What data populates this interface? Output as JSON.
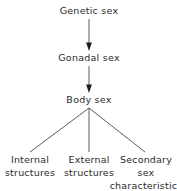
{
  "diagram": {
    "type": "flowchart",
    "background_color": "#ffffff",
    "text_color": "#2b2b2b",
    "line_color": "#4a4a4a",
    "nodes": [
      {
        "id": "genetic",
        "label": "Genetic sex",
        "x": 89,
        "y": 11
      },
      {
        "id": "gonadal",
        "label": "Gonadal sex",
        "x": 89,
        "y": 58
      },
      {
        "id": "body",
        "label": "Body sex",
        "x": 89,
        "y": 100
      }
    ],
    "leaves": [
      {
        "id": "internal",
        "lines": [
          "Internal",
          "structures"
        ],
        "x": 30
      },
      {
        "id": "external",
        "lines": [
          "External",
          "structures"
        ],
        "x": 89
      },
      {
        "id": "secondary",
        "lines": [
          "Secondary",
          "sex",
          "characteristics"
        ],
        "x": 146
      }
    ],
    "edges": [
      {
        "from": "genetic",
        "to": "gonadal",
        "style": "arrow"
      },
      {
        "from": "gonadal",
        "to": "body",
        "style": "arrow"
      },
      {
        "from": "body",
        "to": "internal",
        "style": "line"
      },
      {
        "from": "body",
        "to": "external",
        "style": "line"
      },
      {
        "from": "body",
        "to": "secondary",
        "style": "line"
      }
    ]
  }
}
